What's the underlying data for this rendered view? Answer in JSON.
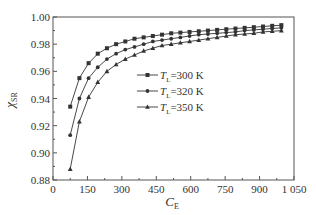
{
  "chart_data": {
    "type": "line",
    "title": "",
    "xlabel": "C",
    "xlabel_sub": "E",
    "ylabel": "χ",
    "ylabel_sub": "SR",
    "xlim": [
      0,
      1050
    ],
    "ylim": [
      0.88,
      1.0
    ],
    "xticks": [
      0,
      150,
      300,
      450,
      600,
      750,
      900,
      1050
    ],
    "xtick_labels": [
      "0",
      "150",
      "300",
      "450",
      "600",
      "750",
      "900",
      "1 050"
    ],
    "yticks": [
      0.88,
      0.9,
      0.92,
      0.94,
      0.96,
      0.98,
      1.0
    ],
    "ytick_labels": [
      "0.88",
      "0.90",
      "0.92",
      "0.94",
      "0.96",
      "0.98",
      "1.00"
    ],
    "grid": false,
    "legend_position": "center-left-inside",
    "x": [
      75,
      115,
      155,
      195,
      235,
      275,
      315,
      355,
      395,
      435,
      475,
      515,
      555,
      595,
      635,
      675,
      715,
      755,
      795,
      835,
      875,
      915,
      955,
      995
    ],
    "series": [
      {
        "name": "T_L=300 K",
        "legend_main": "T",
        "legend_sub": "L",
        "legend_rest": "=300 K",
        "marker": "square",
        "values": [
          0.934,
          0.955,
          0.966,
          0.973,
          0.977,
          0.98,
          0.982,
          0.984,
          0.985,
          0.986,
          0.987,
          0.988,
          0.9885,
          0.989,
          0.9895,
          0.99,
          0.9905,
          0.991,
          0.9915,
          0.992,
          0.9925,
          0.993,
          0.9935,
          0.994
        ]
      },
      {
        "name": "T_L=320 K",
        "legend_main": "T",
        "legend_sub": "L",
        "legend_rest": "=320 K",
        "marker": "circle",
        "values": [
          0.913,
          0.94,
          0.955,
          0.963,
          0.969,
          0.973,
          0.976,
          0.978,
          0.98,
          0.982,
          0.983,
          0.984,
          0.985,
          0.986,
          0.987,
          0.9875,
          0.988,
          0.9885,
          0.989,
          0.99,
          0.9905,
          0.991,
          0.9915,
          0.992
        ]
      },
      {
        "name": "T_L=350 K",
        "legend_main": "T",
        "legend_sub": "L",
        "legend_rest": "=350 K",
        "marker": "triangle",
        "values": [
          0.888,
          0.923,
          0.941,
          0.952,
          0.96,
          0.965,
          0.969,
          0.972,
          0.975,
          0.977,
          0.979,
          0.98,
          0.981,
          0.982,
          0.983,
          0.984,
          0.985,
          0.986,
          0.987,
          0.9875,
          0.988,
          0.989,
          0.9895,
          0.99
        ]
      }
    ]
  },
  "colors": {
    "axis": "#555555",
    "line": "#333333",
    "text": "#333333"
  }
}
